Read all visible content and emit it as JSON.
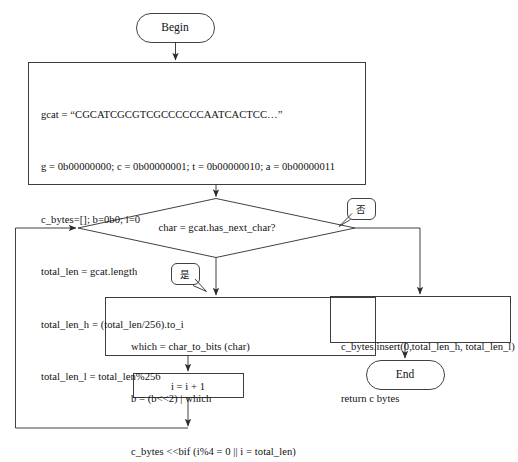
{
  "diagram": {
    "type": "flowchart",
    "stroke_color": "#2b2b2b",
    "background": "#ffffff"
  },
  "nodes": {
    "begin": {
      "label": "Begin",
      "shape": "terminator"
    },
    "init": {
      "shape": "process",
      "lines": [
        "gcat = “CGCATCGCGTCGCCCCCCAATCACTCC…”",
        "g = 0b00000000; c = 0b00000001; t = 0b00000010; a = 0b00000011",
        "c_bytes=[]; b=0b0; i=0",
        "total_len = gcat.length",
        "total_len_h = (total_len/256).to_i",
        "total_len_l = total_len%256"
      ]
    },
    "decision": {
      "shape": "diamond",
      "label": "char = gcat.has_next_char?"
    },
    "loop_body": {
      "shape": "process",
      "lines": [
        "which = char_to_bits (char)",
        "b = (b<<2) | which",
        "c_bytes <<bif (i%4 = 0 || i = total_len)"
      ]
    },
    "increment": {
      "shape": "process",
      "label": "i = i + 1"
    },
    "finalize": {
      "shape": "process",
      "lines": [
        "c_bytes.insert(0,total_len_h, total_len_l)",
        "return c bytes"
      ]
    },
    "end": {
      "label": "End",
      "shape": "terminator"
    }
  },
  "edge_labels": {
    "no": "否",
    "yes": "是"
  }
}
